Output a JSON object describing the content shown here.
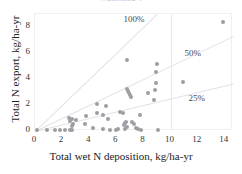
{
  "chart_data": {
    "type": "scatter",
    "title": "Watershed 4",
    "xlabel": "Total wet N deposition, kg/ha-yr",
    "ylabel": "Total  N  export, kg/ha-yr",
    "xlim": [
      0,
      14.6
    ],
    "ylim": [
      0,
      9.0
    ],
    "xticks": [
      0,
      2,
      4,
      6,
      8,
      10,
      12,
      14
    ],
    "yticks": [
      0,
      2,
      4,
      6,
      8
    ],
    "grid": "vertical gridline at x=10 only",
    "legend": "none; reference lines labeled in-plot",
    "point_color": "#9d9da3",
    "line_color": "#e2e2e6",
    "reference_lines": [
      {
        "label": "100%",
        "slope": 1.0,
        "label_x": 6.6,
        "label_y": 8.55
      },
      {
        "label": "50%",
        "slope": 0.5,
        "label_x": 11.1,
        "label_y": 5.95
      },
      {
        "label": "25%",
        "slope": 0.25,
        "label_x": 11.4,
        "label_y": 2.45
      }
    ],
    "series": [
      {
        "name": "watershed sites",
        "points": [
          [
            0.15,
            0.05
          ],
          [
            0.9,
            0.05
          ],
          [
            1.5,
            0.05
          ],
          [
            1.85,
            0.05
          ],
          [
            2.2,
            0.05
          ],
          [
            2.55,
            0.05
          ],
          [
            2.7,
            0.1
          ],
          [
            2.75,
            0.35
          ],
          [
            2.6,
            0.75
          ],
          [
            2.75,
            0.95
          ],
          [
            2.5,
            1.0
          ],
          [
            2.8,
            0.55
          ],
          [
            3.0,
            0.85
          ],
          [
            3.7,
            0.55
          ],
          [
            3.75,
            1.15
          ],
          [
            4.3,
            0.2
          ],
          [
            4.55,
            1.35
          ],
          [
            4.6,
            2.1
          ],
          [
            5.0,
            0.15
          ],
          [
            5.05,
            1.25
          ],
          [
            5.2,
            1.95
          ],
          [
            5.35,
            0.9
          ],
          [
            5.5,
            0.1
          ],
          [
            6.0,
            0.1
          ],
          [
            6.1,
            0.15
          ],
          [
            6.25,
            1.45
          ],
          [
            6.5,
            1.4
          ],
          [
            6.55,
            0.45
          ],
          [
            6.6,
            0.6
          ],
          [
            6.65,
            0.15
          ],
          [
            6.7,
            0.7
          ],
          [
            6.75,
            0.3
          ],
          [
            6.8,
            5.5
          ],
          [
            6.75,
            3.25
          ],
          [
            6.85,
            3.1
          ],
          [
            6.9,
            2.95
          ],
          [
            7.0,
            2.8
          ],
          [
            7.1,
            2.6
          ],
          [
            7.15,
            0.7
          ],
          [
            7.3,
            0.55
          ],
          [
            7.45,
            0.2
          ],
          [
            7.6,
            0.15
          ],
          [
            7.75,
            1.2
          ],
          [
            7.8,
            0.05
          ],
          [
            8.35,
            2.95
          ],
          [
            8.8,
            2.4
          ],
          [
            8.85,
            3.15
          ],
          [
            8.9,
            3.7
          ],
          [
            8.95,
            4.55
          ],
          [
            9.0,
            5.15
          ],
          [
            9.1,
            0.1
          ],
          [
            10.9,
            3.75
          ],
          [
            13.85,
            8.4
          ]
        ]
      }
    ]
  }
}
